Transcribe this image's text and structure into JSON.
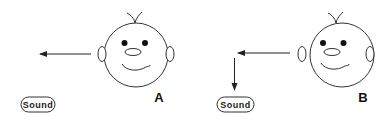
{
  "panels": [
    {
      "id": "A",
      "label": "A",
      "sound_label": "Sound",
      "arrow": "sound emitted horizontally to the left from face"
    },
    {
      "id": "B",
      "label": "B",
      "sound_label": "Sound",
      "arrow": "sound emitted to the left then deflected downward"
    }
  ],
  "colors": {
    "stroke": "#222222",
    "background": "#ffffff"
  }
}
